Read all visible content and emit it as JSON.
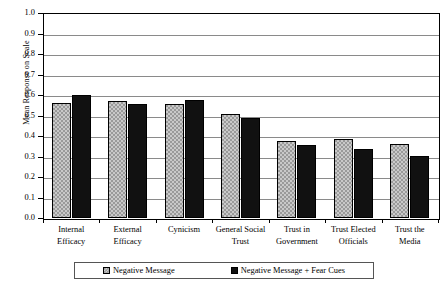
{
  "chart_data": {
    "type": "bar",
    "title": "",
    "subtitle": "",
    "xlabel": "",
    "ylabel": "Mean Response on Scale",
    "ylim": [
      0.0,
      1.0
    ],
    "ytick_labels": [
      "1.0",
      "0.9",
      "0.8",
      "0.7",
      "0.6",
      "0.5",
      "0.4",
      "0.3",
      "0.2",
      "0.1",
      "0.0"
    ],
    "ytick_values": [
      1.0,
      0.9,
      0.8,
      0.7,
      0.6,
      0.5,
      0.4,
      0.3,
      0.2,
      0.1,
      0.0
    ],
    "grid": true,
    "grid_axis": "y",
    "legend_position": "bottom",
    "categories": [
      "Internal Efficacy",
      "External Efficacy",
      "Cynicism",
      "General Social Trust",
      "Trust in Government",
      "Trust Elected Officials",
      "Trust the Media"
    ],
    "category_lines": [
      [
        "Internal",
        "Efficacy"
      ],
      [
        "External",
        "Efficacy"
      ],
      [
        "Cynicism",
        ""
      ],
      [
        "General Social",
        "Trust"
      ],
      [
        "Trust in",
        "Government"
      ],
      [
        "Trust Elected",
        "Officials"
      ],
      [
        "Trust the",
        "Media"
      ]
    ],
    "series": [
      {
        "name": "Negative Message",
        "fill": "checkered-gray",
        "color": "#9a9a9a",
        "values": [
          0.56,
          0.57,
          0.555,
          0.505,
          0.376,
          0.384,
          0.363
        ]
      },
      {
        "name": "Negative Message + Fear Cues",
        "fill": "solid-black",
        "color": "#111111",
        "values": [
          0.6,
          0.558,
          0.578,
          0.489,
          0.355,
          0.335,
          0.303
        ]
      }
    ]
  },
  "legend": {
    "items": [
      {
        "label": "Negative Message"
      },
      {
        "label": "Negative Message + Fear Cues"
      }
    ]
  }
}
